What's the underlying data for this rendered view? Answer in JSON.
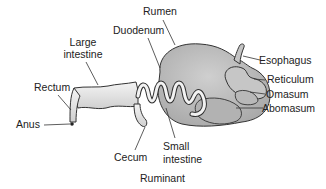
{
  "diagram": {
    "type": "anatomical-labeled-illustration",
    "caption": "Ruminant",
    "labels": {
      "rumen": "Rumen",
      "duodenum": "Duodenum",
      "large_intestine_1": "Large",
      "large_intestine_2": "intestine",
      "rectum": "Rectum",
      "anus": "Anus",
      "esophagus": "Esophagus",
      "reticulum": "Reticulum",
      "omasum": "Omasum",
      "abomasum": "Abomasum",
      "cecum": "Cecum",
      "small_intestine_1": "Small",
      "small_intestine_2": "intestine"
    },
    "colors": {
      "organ_fill": "#bdbdbd",
      "organ_fill_light": "#d6d6d6",
      "outline": "#333333",
      "leader_line": "#333333",
      "text": "#222222",
      "background": "#ffffff"
    }
  }
}
